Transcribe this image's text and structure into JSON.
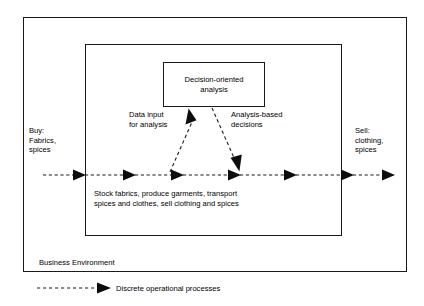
{
  "diagram": {
    "title_not_shown": "",
    "outer_container": {
      "label": "Business Environment"
    },
    "inner_container": {
      "process_caption_line1": "Stock fabrics, produce garments, transport",
      "process_caption_line2": "spices and clothes, sell clothing and spices"
    },
    "decision_box": {
      "line1": "Decision-oriented",
      "line2": "analysis"
    },
    "inputs": {
      "buy_line1": "Buy:",
      "buy_line2": "Fabrics,",
      "buy_line3": "spices"
    },
    "outputs": {
      "sell_line1": "Sell:",
      "sell_line2": "clothing,",
      "sell_line3": "spices"
    },
    "annotations": {
      "data_input_line1": "Data input",
      "data_input_line2": "for analysis",
      "analysis_based_line1": "Analysis-based",
      "analysis_based_line2": "decisions"
    }
  },
  "legend": {
    "arrow_icon": "dashed-arrow-icon",
    "label": "Discrete operational processes"
  },
  "style": {
    "line_color": "#1a1a1a",
    "text_color": "#000000",
    "background": "#ffffff"
  }
}
